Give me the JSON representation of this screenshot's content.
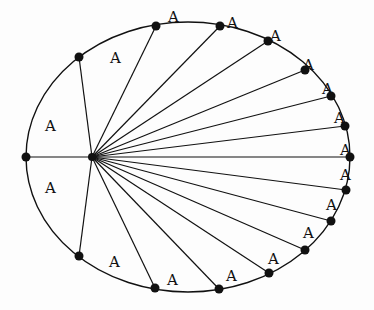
{
  "diagram": {
    "sector_label": "A",
    "colors": {
      "stroke": "#111111",
      "background": "#fdfdfd"
    },
    "ellipse": {
      "cx": 188,
      "cy": 157,
      "rx": 162,
      "ry": 135
    },
    "focus": {
      "x": 92,
      "y": 157
    },
    "points": [
      {
        "x": 26,
        "y": 157
      },
      {
        "x": 79,
        "y": 57
      },
      {
        "x": 156,
        "y": 26
      },
      {
        "x": 220,
        "y": 26
      },
      {
        "x": 268,
        "y": 41
      },
      {
        "x": 305,
        "y": 70
      },
      {
        "x": 331,
        "y": 96
      },
      {
        "x": 345,
        "y": 126
      },
      {
        "x": 350,
        "y": 157
      },
      {
        "x": 346,
        "y": 190
      },
      {
        "x": 331,
        "y": 221
      },
      {
        "x": 305,
        "y": 250
      },
      {
        "x": 269,
        "y": 273
      },
      {
        "x": 219,
        "y": 289
      },
      {
        "x": 155,
        "y": 288
      },
      {
        "x": 79,
        "y": 256
      }
    ],
    "labels": [
      {
        "text": "A",
        "x": 45,
        "y": 126
      },
      {
        "text": "A",
        "x": 110,
        "y": 58
      },
      {
        "text": "A",
        "x": 168,
        "y": 17
      },
      {
        "text": "A",
        "x": 227,
        "y": 23
      },
      {
        "text": "A",
        "x": 270,
        "y": 36
      },
      {
        "text": "A",
        "x": 303,
        "y": 65
      },
      {
        "text": "A",
        "x": 322,
        "y": 89
      },
      {
        "text": "A",
        "x": 334,
        "y": 118
      },
      {
        "text": "A",
        "x": 340,
        "y": 150
      },
      {
        "text": "A",
        "x": 340,
        "y": 175
      },
      {
        "text": "A",
        "x": 326,
        "y": 205
      },
      {
        "text": "A",
        "x": 303,
        "y": 233
      },
      {
        "text": "A",
        "x": 268,
        "y": 259
      },
      {
        "text": "A",
        "x": 226,
        "y": 276
      },
      {
        "text": "A",
        "x": 167,
        "y": 280
      },
      {
        "text": "A",
        "x": 109,
        "y": 262
      },
      {
        "text": "A",
        "x": 45,
        "y": 188
      }
    ]
  }
}
